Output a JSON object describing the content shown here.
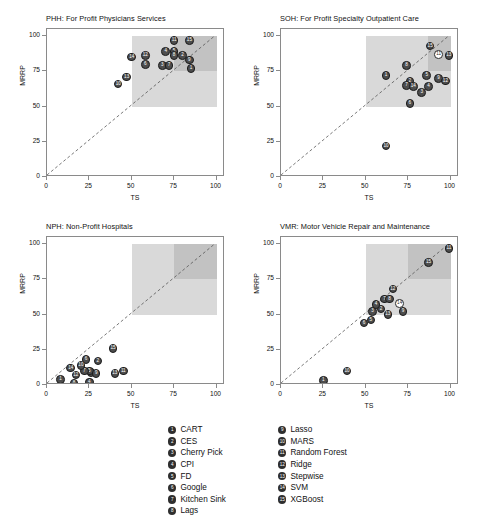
{
  "figure": {
    "width": 485,
    "height": 532,
    "axis_label_x": "TS",
    "axis_label_y": "MRRP",
    "ticks": [
      0,
      25,
      50,
      75,
      100
    ],
    "colors": {
      "point_fill": "#4d4d4d",
      "point_edge": "#1c1c1c",
      "shade_light": "#d9d9d9",
      "shade_dark": "#c2c2c2",
      "axis": "#8a8a8a",
      "text": "#111111"
    }
  },
  "legend": {
    "columns": [
      [
        {
          "id": "1",
          "label": "CART"
        },
        {
          "id": "2",
          "label": "CES"
        },
        {
          "id": "3",
          "label": "Cherry Pick"
        },
        {
          "id": "4",
          "label": "CPI"
        },
        {
          "id": "5",
          "label": "FD"
        },
        {
          "id": "6",
          "label": "Google"
        },
        {
          "id": "7",
          "label": "Kitchen Sink"
        },
        {
          "id": "8",
          "label": "Lags"
        }
      ],
      [
        {
          "id": "9",
          "label": "Lasso"
        },
        {
          "id": "10",
          "label": "MARS"
        },
        {
          "id": "11",
          "label": "Random Forest"
        },
        {
          "id": "12",
          "label": "Ridge"
        },
        {
          "id": "13",
          "label": "Stepwise"
        },
        {
          "id": "14",
          "label": "SVM"
        },
        {
          "id": "15",
          "label": "XGBoost"
        }
      ]
    ]
  },
  "chart_data": [
    {
      "type": "scatter",
      "panel_key": "PHH",
      "title": "PHH: For Profit Physicians Services",
      "xlabel": "TS",
      "ylabel": "MRRP",
      "xlim": [
        0,
        105
      ],
      "ylim": [
        0,
        105
      ],
      "xticks": [
        0,
        25,
        50,
        75,
        100
      ],
      "yticks": [
        0,
        25,
        50,
        75,
        100
      ],
      "grid": false,
      "reference_line": "y = x (dashed diagonal)",
      "shaded_regions": [
        {
          "x0": 50,
          "x1": 100,
          "y0": 50,
          "y1": 100,
          "shade": "light"
        },
        {
          "x0": 75,
          "x1": 100,
          "y0": 75,
          "y1": 100,
          "shade": "dark"
        }
      ],
      "points": [
        {
          "id": "1",
          "label": "CART",
          "x": 85,
          "y": 77,
          "open": false
        },
        {
          "id": "2",
          "label": "CES",
          "x": 80,
          "y": 86,
          "open": false
        },
        {
          "id": "3",
          "label": "Cherry Pick",
          "x": 68,
          "y": 79,
          "open": false
        },
        {
          "id": "4",
          "label": "CPI",
          "x": 70,
          "y": 89,
          "open": false
        },
        {
          "id": "5",
          "label": "FD",
          "x": 75,
          "y": 89,
          "open": false
        },
        {
          "id": "6",
          "label": "Google",
          "x": 58,
          "y": 80,
          "open": false
        },
        {
          "id": "7",
          "label": "Kitchen Sink",
          "x": 72,
          "y": 79,
          "open": false
        },
        {
          "id": "8",
          "label": "Lags",
          "x": 75,
          "y": 86,
          "open": false
        },
        {
          "id": "9",
          "label": "Lasso",
          "x": 84,
          "y": 83,
          "open": false
        },
        {
          "id": "10",
          "label": "MARS",
          "x": 42,
          "y": 66,
          "open": false
        },
        {
          "id": "11",
          "label": "Random Forest",
          "x": 75,
          "y": 97,
          "open": false
        },
        {
          "id": "12",
          "label": "Ridge",
          "x": 58,
          "y": 86,
          "open": false
        },
        {
          "id": "13",
          "label": "Stepwise",
          "x": 47,
          "y": 71,
          "open": false
        },
        {
          "id": "14",
          "label": "SVM",
          "x": 50,
          "y": 85,
          "open": false
        },
        {
          "id": "15",
          "label": "XGBoost",
          "x": 84,
          "y": 97,
          "open": false
        }
      ]
    },
    {
      "type": "scatter",
      "panel_key": "SOH",
      "title": "SOH: For Profit Specialty Outpatient Care",
      "xlabel": "TS",
      "ylabel": "MRRP",
      "xlim": [
        0,
        105
      ],
      "ylim": [
        0,
        105
      ],
      "xticks": [
        0,
        25,
        50,
        75,
        100
      ],
      "yticks": [
        0,
        25,
        50,
        75,
        100
      ],
      "grid": false,
      "reference_line": "y = x (dashed diagonal)",
      "shaded_regions": [
        {
          "x0": 50,
          "x1": 100,
          "y0": 50,
          "y1": 100,
          "shade": "light"
        },
        {
          "x0": 87,
          "x1": 100,
          "y0": 75,
          "y1": 100,
          "shade": "dark"
        }
      ],
      "points": [
        {
          "id": "1",
          "label": "CART",
          "x": 62,
          "y": 72,
          "open": false
        },
        {
          "id": "2",
          "label": "CES",
          "x": 76,
          "y": 68,
          "open": false
        },
        {
          "id": "3",
          "label": "Cherry Pick",
          "x": 83,
          "y": 60,
          "open": false
        },
        {
          "id": "4",
          "label": "CPI",
          "x": 87,
          "y": 64,
          "open": false
        },
        {
          "id": "5",
          "label": "FD",
          "x": 86,
          "y": 72,
          "open": false
        },
        {
          "id": "6",
          "label": "Google",
          "x": 76,
          "y": 52,
          "open": false
        },
        {
          "id": "7",
          "label": "Kitchen Sink",
          "x": 74,
          "y": 65,
          "open": false
        },
        {
          "id": "8",
          "label": "Lags",
          "x": 74,
          "y": 79,
          "open": false
        },
        {
          "id": "9",
          "label": "Lasso",
          "x": 93,
          "y": 70,
          "open": false
        },
        {
          "id": "10",
          "label": "MARS",
          "x": 62,
          "y": 22,
          "open": false
        },
        {
          "id": "11",
          "label": "Random Forest",
          "x": 93,
          "y": 87,
          "open": true
        },
        {
          "id": "12",
          "label": "Ridge",
          "x": 97,
          "y": 68,
          "open": false
        },
        {
          "id": "13",
          "label": "Stepwise",
          "x": 99,
          "y": 86,
          "open": false
        },
        {
          "id": "14",
          "label": "SVM",
          "x": 78,
          "y": 64,
          "open": false
        },
        {
          "id": "15",
          "label": "XGBoost",
          "x": 88,
          "y": 93,
          "open": false
        }
      ]
    },
    {
      "type": "scatter",
      "panel_key": "NPH",
      "title": "NPH: Non-Profit Hospitals",
      "xlabel": "TS",
      "ylabel": "MRRP",
      "xlim": [
        0,
        105
      ],
      "ylim": [
        0,
        105
      ],
      "xticks": [
        0,
        25,
        50,
        75,
        100
      ],
      "yticks": [
        0,
        25,
        50,
        75,
        100
      ],
      "grid": false,
      "reference_line": "y = x (dashed diagonal)",
      "shaded_regions": [
        {
          "x0": 50,
          "x1": 100,
          "y0": 50,
          "y1": 100,
          "shade": "light"
        },
        {
          "x0": 75,
          "x1": 100,
          "y0": 75,
          "y1": 100,
          "shade": "dark"
        }
      ],
      "points": [
        {
          "id": "1",
          "label": "CART",
          "x": 8,
          "y": 4,
          "open": false
        },
        {
          "id": "2",
          "label": "CES",
          "x": 30,
          "y": 17,
          "open": false
        },
        {
          "id": "3",
          "label": "Cherry Pick",
          "x": 26,
          "y": 9,
          "open": false
        },
        {
          "id": "4",
          "label": "CPI",
          "x": 25,
          "y": 2,
          "open": false
        },
        {
          "id": "5",
          "label": "FD",
          "x": 25,
          "y": 10,
          "open": false
        },
        {
          "id": "6",
          "label": "Google",
          "x": 23,
          "y": 18,
          "open": false
        },
        {
          "id": "7",
          "label": "Kitchen Sink",
          "x": 22,
          "y": 10,
          "open": false
        },
        {
          "id": "8",
          "label": "Lags",
          "x": 16,
          "y": 1,
          "open": false
        },
        {
          "id": "9",
          "label": "Lasso",
          "x": 29,
          "y": 8,
          "open": false
        },
        {
          "id": "10",
          "label": "MARS",
          "x": 20,
          "y": 14,
          "open": false
        },
        {
          "id": "11",
          "label": "Random Forest",
          "x": 45,
          "y": 10,
          "open": false
        },
        {
          "id": "12",
          "label": "Ridge",
          "x": 17,
          "y": 7,
          "open": false
        },
        {
          "id": "13",
          "label": "Stepwise",
          "x": 40,
          "y": 8,
          "open": false
        },
        {
          "id": "14",
          "label": "SVM",
          "x": 14,
          "y": 12,
          "open": false
        },
        {
          "id": "15",
          "label": "XGBoost",
          "x": 39,
          "y": 26,
          "open": false
        }
      ]
    },
    {
      "type": "scatter",
      "panel_key": "VMR",
      "title": "VMR: Motor Vehicle Repair and Maintenance",
      "xlabel": "TS",
      "ylabel": "MRRP",
      "xlim": [
        0,
        105
      ],
      "ylim": [
        0,
        105
      ],
      "xticks": [
        0,
        25,
        50,
        75,
        100
      ],
      "yticks": [
        0,
        25,
        50,
        75,
        100
      ],
      "grid": false,
      "reference_line": "y = x (dashed diagonal)",
      "shaded_regions": [
        {
          "x0": 50,
          "x1": 100,
          "y0": 50,
          "y1": 100,
          "shade": "light"
        },
        {
          "x0": 75,
          "x1": 100,
          "y0": 75,
          "y1": 100,
          "shade": "dark"
        }
      ],
      "points": [
        {
          "id": "1",
          "label": "CART",
          "x": 25,
          "y": 3,
          "open": false
        },
        {
          "id": "2",
          "label": "CES",
          "x": 59,
          "y": 54,
          "open": false
        },
        {
          "id": "3",
          "label": "Cherry Pick",
          "x": 54,
          "y": 52,
          "open": false
        },
        {
          "id": "4",
          "label": "CPI",
          "x": 56,
          "y": 57,
          "open": false
        },
        {
          "id": "5",
          "label": "FD",
          "x": 53,
          "y": 46,
          "open": false
        },
        {
          "id": "6",
          "label": "Google",
          "x": 49,
          "y": 44,
          "open": false
        },
        {
          "id": "7",
          "label": "Kitchen Sink",
          "x": 61,
          "y": 61,
          "open": false
        },
        {
          "id": "8",
          "label": "Lags",
          "x": 64,
          "y": 61,
          "open": false
        },
        {
          "id": "9",
          "label": "Lasso",
          "x": 72,
          "y": 52,
          "open": false
        },
        {
          "id": "10",
          "label": "MARS",
          "x": 39,
          "y": 10,
          "open": false
        },
        {
          "id": "11",
          "label": "Random Forest",
          "x": 99,
          "y": 97,
          "open": false
        },
        {
          "id": "12",
          "label": "Ridge",
          "x": 66,
          "y": 68,
          "open": false
        },
        {
          "id": "13",
          "label": "Stepwise",
          "x": 63,
          "y": 50,
          "open": false
        },
        {
          "id": "14",
          "label": "SVM",
          "x": 70,
          "y": 58,
          "open": true
        },
        {
          "id": "15",
          "label": "XGBoost",
          "x": 87,
          "y": 87,
          "open": false
        }
      ]
    }
  ]
}
